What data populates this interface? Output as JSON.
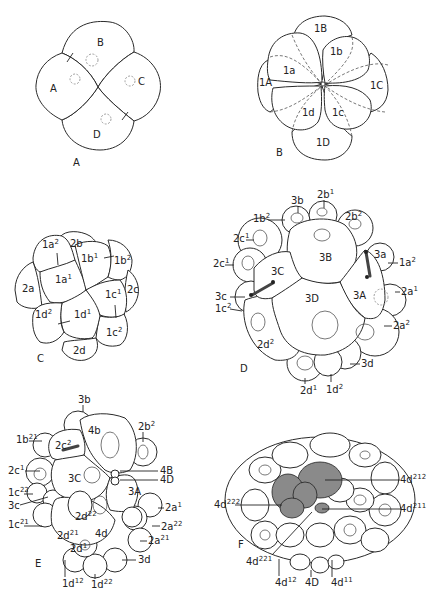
{
  "figure": {
    "panels": [
      {
        "id": "A",
        "caption": "A",
        "cells": [
          "A",
          "B",
          "C",
          "D"
        ]
      },
      {
        "id": "B",
        "caption": "B",
        "cells": [
          "1A",
          "1B",
          "1C",
          "1D",
          "1a",
          "1b",
          "1c",
          "1d"
        ]
      },
      {
        "id": "C",
        "caption": "C",
        "cells": [
          "1a²",
          "1a¹",
          "1b¹",
          "1b²",
          "2a",
          "2b",
          "2c",
          "2d",
          "1c¹",
          "1c²",
          "1d¹",
          "1d²"
        ]
      },
      {
        "id": "D",
        "caption": "D",
        "cells": [
          "3A",
          "3B",
          "3C",
          "3D"
        ],
        "labels": [
          "3b",
          "2b¹",
          "1b²",
          "2b²",
          "2c¹",
          "2c¹",
          "3a",
          "1a²",
          "2a¹",
          "3c",
          "1c²",
          "2a²",
          "2d²",
          "3d",
          "2d¹",
          "1d²"
        ]
      },
      {
        "id": "E",
        "caption": "E",
        "cells": [
          "4b",
          "3C",
          "3A",
          "4d"
        ],
        "labels": [
          "3b",
          "1b²¹",
          "2c²",
          "2b²",
          "2c¹",
          "4B",
          "4D",
          "1c²²",
          "3c",
          "1c²¹",
          "2d²²",
          "2a¹",
          "2a²²",
          "2d²¹",
          "2a²¹",
          "2d¹",
          "3d",
          "1d¹²",
          "1d²²"
        ]
      },
      {
        "id": "F",
        "caption": "F",
        "labels": [
          "4d²¹²",
          "4d²²²",
          "4d²¹¹",
          "4d²²¹",
          "4d¹²",
          "4D",
          "4d¹¹"
        ]
      }
    ]
  },
  "text": {
    "A": {
      "cap": "A",
      "A": "A",
      "B": "B",
      "C": "C",
      "D": "D"
    },
    "B": {
      "cap": "B",
      "1B": "1B",
      "1b": "1b",
      "1a": "1a",
      "1A": "1A",
      "1C": "1C",
      "1d": "1d",
      "1c": "1c",
      "1D": "1D"
    },
    "C": {
      "cap": "C"
    },
    "D": {
      "cap": "D",
      "3B": "3B",
      "3C": "3C",
      "3D": "3D",
      "3A": "3A"
    },
    "E": {
      "cap": "E",
      "4b": "4b",
      "3C": "3C",
      "3A": "3A",
      "4d": "4d"
    },
    "F": {
      "cap": "F"
    }
  }
}
